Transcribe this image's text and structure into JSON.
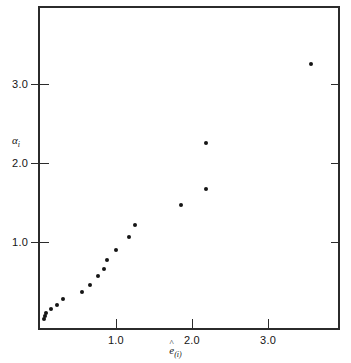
{
  "chart_data": {
    "type": "scatter",
    "title": "",
    "xlabel": "ê(i)",
    "ylabel": "αi",
    "xlabel_base": "e",
    "xlabel_sub": "(i)",
    "ylabel_base": "α",
    "ylabel_sub": "i",
    "xlim": [
      -0.026,
      3.947
    ],
    "ylim": [
      -0.114,
      3.987
    ],
    "xticks": [
      1.0,
      2.0,
      3.0
    ],
    "xticklabels": [
      "1.0",
      "2.0",
      "3.0"
    ],
    "yticks": [
      1.0,
      2.0,
      3.0
    ],
    "yticklabels": [
      "1.0",
      "2.0",
      "3.0"
    ],
    "grid": false,
    "legend": null,
    "marker": "filled-circle",
    "marker_color": "#151515",
    "frame_color": "#2b2b2b",
    "background": "#ffffff",
    "n_points": 20,
    "points": [
      {
        "x": 0.05,
        "y": 0.03
      },
      {
        "x": 0.07,
        "y": 0.06
      },
      {
        "x": 0.08,
        "y": 0.1
      },
      {
        "x": 0.14,
        "y": 0.15
      },
      {
        "x": 0.22,
        "y": 0.2
      },
      {
        "x": 0.3,
        "y": 0.28
      },
      {
        "x": 0.55,
        "y": 0.37
      },
      {
        "x": 0.66,
        "y": 0.46
      },
      {
        "x": 0.76,
        "y": 0.57
      },
      {
        "x": 0.84,
        "y": 0.66
      },
      {
        "x": 0.88,
        "y": 0.77
      },
      {
        "x": 1.0,
        "y": 0.9
      },
      {
        "x": 1.17,
        "y": 1.06
      },
      {
        "x": 1.25,
        "y": 1.21
      },
      {
        "x": 1.86,
        "y": 1.47
      },
      {
        "x": 2.18,
        "y": 1.67
      },
      {
        "x": 2.18,
        "y": 2.25
      },
      {
        "x": 3.57,
        "y": 3.25
      }
    ]
  },
  "axes": {
    "x_tick_values": [
      "1.0",
      "2.0",
      "3.0"
    ],
    "y_tick_values": [
      "1.0",
      "2.0",
      "3.0"
    ]
  }
}
